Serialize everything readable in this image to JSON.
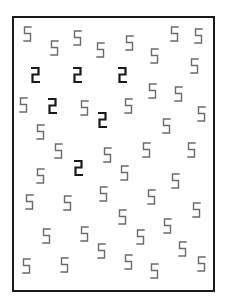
{
  "stimulus": {
    "type": "visual-search",
    "target_char": "2",
    "distractor_char": "5",
    "target_color": "#1a1a1a",
    "distractor_color": "#6b6b6b",
    "frame_color": "#1a1a1a",
    "target_count": 5,
    "distractor_count": 43
  },
  "glyphs": [
    {
      "c": "5",
      "x": 23,
      "y": 26
    },
    {
      "c": "5",
      "x": 50,
      "y": 40
    },
    {
      "c": "5",
      "x": 73,
      "y": 30
    },
    {
      "c": "5",
      "x": 96,
      "y": 42
    },
    {
      "c": "5",
      "x": 125,
      "y": 35
    },
    {
      "c": "5",
      "x": 150,
      "y": 48
    },
    {
      "c": "5",
      "x": 170,
      "y": 26
    },
    {
      "c": "5",
      "x": 194,
      "y": 28
    },
    {
      "c": "2",
      "x": 31,
      "y": 67
    },
    {
      "c": "2",
      "x": 73,
      "y": 67
    },
    {
      "c": "2",
      "x": 118,
      "y": 67
    },
    {
      "c": "5",
      "x": 190,
      "y": 58
    },
    {
      "c": "5",
      "x": 148,
      "y": 83
    },
    {
      "c": "5",
      "x": 174,
      "y": 86
    },
    {
      "c": "5",
      "x": 19,
      "y": 97
    },
    {
      "c": "2",
      "x": 48,
      "y": 98
    },
    {
      "c": "5",
      "x": 80,
      "y": 100
    },
    {
      "c": "2",
      "x": 98,
      "y": 112
    },
    {
      "c": "5",
      "x": 124,
      "y": 98
    },
    {
      "c": "5",
      "x": 197,
      "y": 106
    },
    {
      "c": "5",
      "x": 36,
      "y": 124
    },
    {
      "c": "5",
      "x": 162,
      "y": 118
    },
    {
      "c": "5",
      "x": 54,
      "y": 143
    },
    {
      "c": "5",
      "x": 103,
      "y": 147
    },
    {
      "c": "5",
      "x": 142,
      "y": 142
    },
    {
      "c": "5",
      "x": 187,
      "y": 142
    },
    {
      "c": "2",
      "x": 74,
      "y": 160
    },
    {
      "c": "5",
      "x": 36,
      "y": 168
    },
    {
      "c": "5",
      "x": 120,
      "y": 165
    },
    {
      "c": "5",
      "x": 171,
      "y": 173
    },
    {
      "c": "5",
      "x": 25,
      "y": 194
    },
    {
      "c": "5",
      "x": 63,
      "y": 195
    },
    {
      "c": "5",
      "x": 99,
      "y": 186
    },
    {
      "c": "5",
      "x": 147,
      "y": 189
    },
    {
      "c": "5",
      "x": 192,
      "y": 202
    },
    {
      "c": "5",
      "x": 118,
      "y": 209
    },
    {
      "c": "5",
      "x": 42,
      "y": 228
    },
    {
      "c": "5",
      "x": 80,
      "y": 226
    },
    {
      "c": "5",
      "x": 97,
      "y": 243
    },
    {
      "c": "5",
      "x": 136,
      "y": 229
    },
    {
      "c": "5",
      "x": 163,
      "y": 218
    },
    {
      "c": "5",
      "x": 178,
      "y": 241
    },
    {
      "c": "5",
      "x": 22,
      "y": 258
    },
    {
      "c": "5",
      "x": 60,
      "y": 257
    },
    {
      "c": "5",
      "x": 124,
      "y": 254
    },
    {
      "c": "5",
      "x": 150,
      "y": 263
    },
    {
      "c": "5",
      "x": 197,
      "y": 256
    }
  ]
}
